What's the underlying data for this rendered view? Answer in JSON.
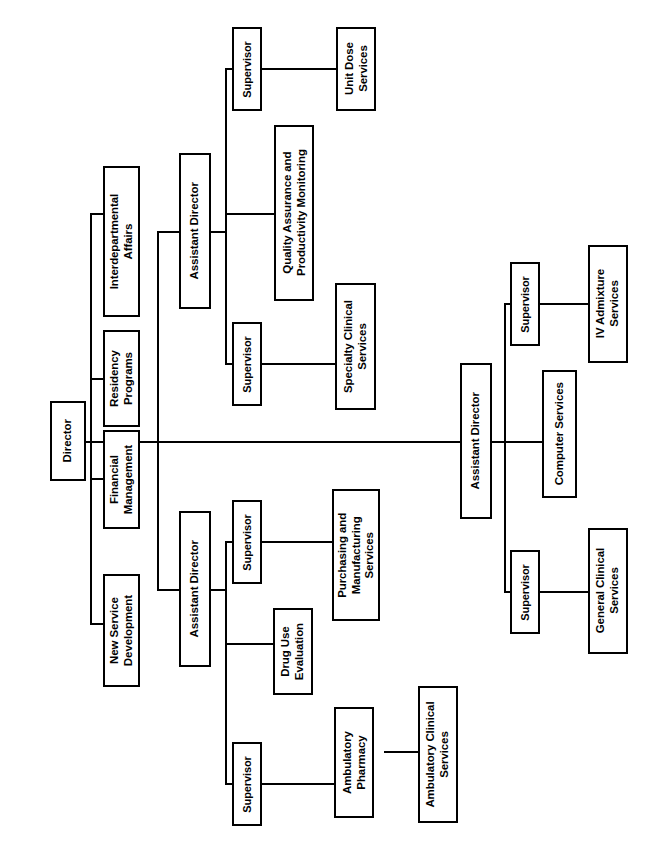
{
  "chart": {
    "kind": "organizational-chart",
    "orientation": "rotated-90-ccw",
    "line_color": "#000000",
    "box_border_color": "#000000",
    "box_fill_color": "#ffffff",
    "background_color": "#ffffff"
  },
  "nodes": {
    "director": "Director",
    "staff": {
      "interdepartmental_affairs": "Interdepartmental\nAffairs",
      "residency_programs": "Residency\nPrograms",
      "financial_management": "Financial\nManagement",
      "new_service_development": "New Service\nDevelopment"
    },
    "assistant_director_1": "Assistant Director",
    "assistant_director_2": "Assistant Director",
    "assistant_director_3": "Assistant Director",
    "supervisor_1": "Supervisor",
    "supervisor_2": "Supervisor",
    "supervisor_3": "Supervisor",
    "supervisor_4": "Supervisor",
    "supervisor_5": "Supervisor",
    "supervisor_6": "Supervisor",
    "unit_dose_services": "Unit Dose\nServices",
    "quality_assurance": "Quality Assurance and\nProductivity Monitoring",
    "specialty_clinical_services": "Specialty Clinical\nServices",
    "iv_admixture_services": "IV Admixture\nServices",
    "computer_services": "Computer Services",
    "general_clinical_services": "General Clinical\nServices",
    "purchasing_manufacturing": "Purchasing and\nManufacturing\nServices",
    "drug_use_evaluation": "Drug Use\nEvaluation",
    "ambulatory_pharmacy": "Ambulatory\nPharmacy",
    "ambulatory_clinical_services": "Ambulatory Clinical\nServices"
  },
  "hierarchy": {
    "root": "Director",
    "staff_units": [
      "Interdepartmental Affairs",
      "Residency Programs",
      "Financial Management",
      "New Service Development"
    ],
    "branches": [
      {
        "head": "Assistant Director",
        "children": [
          {
            "role": "Supervisor",
            "unit": "Unit Dose Services"
          },
          {
            "role": null,
            "unit": "Quality Assurance and Productivity Monitoring"
          },
          {
            "role": "Supervisor",
            "unit": "Specialty Clinical Services"
          }
        ]
      },
      {
        "head": "Assistant Director",
        "children": [
          {
            "role": "Supervisor",
            "unit": "IV Admixture Services"
          },
          {
            "role": null,
            "unit": "Computer Services"
          },
          {
            "role": "Supervisor",
            "unit": "General Clinical Services"
          }
        ]
      },
      {
        "head": "Assistant Director",
        "children": [
          {
            "role": "Supervisor",
            "unit": "Purchasing and Manufacturing Services"
          },
          {
            "role": null,
            "unit": "Drug Use Evaluation"
          },
          {
            "role": "Supervisor",
            "unit": "Ambulatory Pharmacy",
            "sub_unit": "Ambulatory Clinical Services"
          }
        ]
      }
    ]
  }
}
